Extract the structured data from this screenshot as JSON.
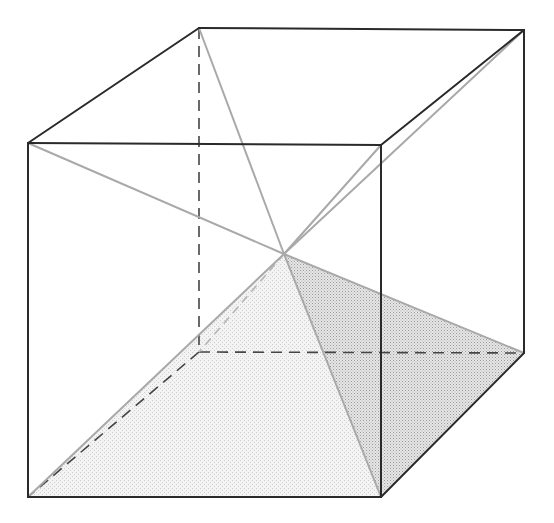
{
  "figure": {
    "title": "",
    "vertex_names": [
      "front-top-left",
      "front-top-right",
      "front-bottom-left",
      "front-bottom-right",
      "back-top-left",
      "back-top-right",
      "back-bottom-left",
      "back-bottom-right",
      "center"
    ],
    "colors": {
      "edge": "#2a2a2a",
      "hidden_edge": "#444444",
      "diagonal": "#a9a9a9",
      "shade_light": "#e9e9e9",
      "shade_dark": "#cfcfcf"
    },
    "visible_edges": [
      [
        "front-top-left",
        "front-top-right"
      ],
      [
        "front-top-right",
        "front-bottom-right"
      ],
      [
        "front-bottom-right",
        "front-bottom-left"
      ],
      [
        "front-bottom-left",
        "front-top-left"
      ],
      [
        "front-top-left",
        "back-top-left"
      ],
      [
        "back-top-left",
        "back-top-right"
      ],
      [
        "back-top-right",
        "front-top-right"
      ],
      [
        "back-top-right",
        "back-bottom-right"
      ],
      [
        "back-bottom-right",
        "front-bottom-right"
      ]
    ],
    "hidden_edges": [
      [
        "back-top-left",
        "back-bottom-left"
      ],
      [
        "back-bottom-left",
        "back-bottom-right"
      ],
      [
        "back-bottom-left",
        "front-bottom-left"
      ]
    ],
    "diagonals_to_center": [
      "front-top-left",
      "front-top-right",
      "back-top-left",
      "back-top-right",
      "front-bottom-left",
      "front-bottom-right",
      "back-bottom-right"
    ],
    "hidden_diagonals_to_center": [
      "back-bottom-left"
    ],
    "shaded_faces": [
      {
        "name": "pyramid-front-face",
        "vertices": [
          "center",
          "front-bottom-left",
          "front-bottom-right"
        ],
        "tone": "shade_light"
      },
      {
        "name": "pyramid-right-face",
        "vertices": [
          "center",
          "front-bottom-right",
          "back-bottom-right"
        ],
        "tone": "shade_dark"
      }
    ]
  }
}
